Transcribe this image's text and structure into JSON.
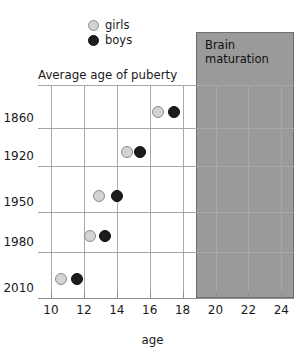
{
  "chart_data": {
    "type": "scatter",
    "title": "Average age of puberty",
    "xlabel": "age",
    "ylabel": "",
    "xlim": [
      9.2,
      24.6
    ],
    "ylim_categories": [
      "1860",
      "1920",
      "1950",
      "1980",
      "2010"
    ],
    "xticks": [
      10,
      12,
      14,
      16,
      18,
      20,
      22,
      24
    ],
    "xtick_labels": [
      "10",
      "12",
      "14",
      "16",
      "18",
      "20",
      "22",
      "24"
    ],
    "ytick_labels": [
      "1860",
      "1920",
      "1950",
      "1980",
      "2010"
    ],
    "grid": true,
    "legend_position": "top-left",
    "legend": [
      {
        "name": "girls",
        "color": "#d4d4d4",
        "edge": "#8a8a8a"
      },
      {
        "name": "boys",
        "color": "#1c1c1c",
        "edge": "#0d0d0d"
      }
    ],
    "series": [
      {
        "name": "girls",
        "points": [
          {
            "year": "1860",
            "age": 16.5
          },
          {
            "year": "1920",
            "age": 14.6
          },
          {
            "year": "1950",
            "age": 12.9
          },
          {
            "year": "1980",
            "age": 12.4
          },
          {
            "year": "2010",
            "age": 10.6
          }
        ]
      },
      {
        "name": "boys",
        "points": [
          {
            "year": "1860",
            "age": 17.5
          },
          {
            "year": "1920",
            "age": 15.4
          },
          {
            "year": "1950",
            "age": 14.0
          },
          {
            "year": "1980",
            "age": 13.3
          },
          {
            "year": "2010",
            "age": 11.6
          }
        ]
      }
    ],
    "annotations": [
      {
        "name": "brain-maturation",
        "label": "Brain maturation",
        "type": "shaded-band",
        "x_start": 18,
        "x_end": 24,
        "color": "#9a9a9a"
      }
    ]
  },
  "legend": {
    "girls_label": "girls",
    "boys_label": "boys"
  },
  "title": "Average age of puberty",
  "brain_band": {
    "label": "Brain maturation"
  },
  "axis": {
    "x_label": "age"
  }
}
